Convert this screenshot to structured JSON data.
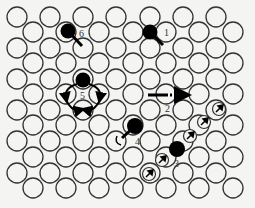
{
  "figure": {
    "colors": {
      "background": "#f4f4f2",
      "lattice": "#333333",
      "atom": "#000000"
    },
    "lattice": {
      "rows_y": [
        17,
        32,
        48,
        63,
        79,
        94,
        110,
        125,
        141,
        157,
        173,
        188
      ],
      "even_row_x": [
        17,
        50,
        83,
        116,
        150,
        183,
        216
      ],
      "odd_row_x": [
        33,
        66,
        99,
        133,
        166,
        199,
        233
      ],
      "radius": 10
    },
    "mechanisms": [
      {
        "id": "1",
        "label": "1",
        "atom": [
          150,
          32
        ],
        "label_pos": [
          164,
          36
        ]
      },
      {
        "id": "2",
        "label": "2",
        "arrow_from": [
          148,
          95
        ],
        "arrow_to": [
          186,
          95
        ],
        "label_pos": [
          165,
          112
        ]
      },
      {
        "id": "3",
        "label": "3",
        "atom": [
          177,
          149
        ],
        "label_pos": [
          174,
          167
        ]
      },
      {
        "id": "4",
        "label": "4",
        "atom": [
          135,
          126
        ],
        "label_pos": [
          135,
          145
        ]
      },
      {
        "id": "5",
        "label": "5",
        "atom": [
          83,
          80
        ],
        "label_pos": [
          80,
          98
        ]
      },
      {
        "id": "6",
        "label": "6",
        "atom": [
          68,
          31
        ],
        "label_pos": [
          79,
          37
        ]
      }
    ],
    "chain_arrow_sites": [
      [
        149,
        174
      ],
      [
        162,
        160
      ],
      [
        190,
        136
      ],
      [
        204,
        122
      ],
      [
        219,
        109
      ]
    ]
  }
}
